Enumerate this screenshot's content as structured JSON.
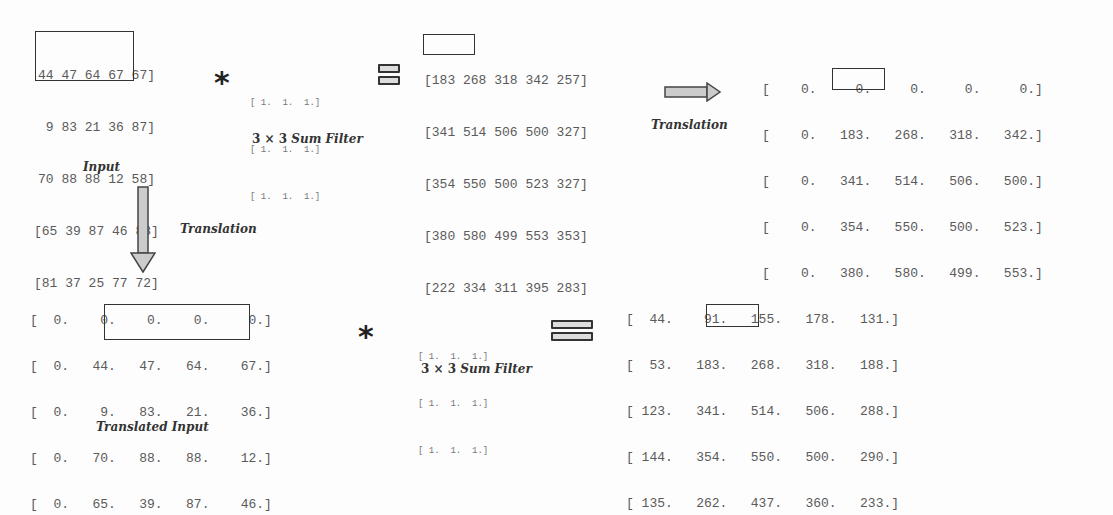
{
  "input": {
    "label": "Input",
    "rows": [
      "44 47 64 67 67]",
      " 9 83 21 36 87]",
      "70 88 88 12 58]",
      "[65 39 87 46 88]",
      "[81 37 25 77 72]"
    ],
    "values": [
      [
        44,
        47,
        64,
        67,
        67
      ],
      [
        9,
        83,
        21,
        36,
        87
      ],
      [
        70,
        88,
        88,
        12,
        58
      ],
      [
        65,
        39,
        87,
        46,
        88
      ],
      [
        81,
        37,
        25,
        77,
        72
      ]
    ]
  },
  "filter_top": {
    "label_prefix": "3 × 3 ",
    "label_italic": "Sum Filter",
    "rows": [
      "[ 1.  1.  1.]",
      "[ 1.  1.  1.]",
      "[ 1.  1.  1.]"
    ]
  },
  "output_top": {
    "rows": [
      "[183 268 318 342 257]",
      "[341 514 506 500 327]",
      "[354 550 500 523 327]",
      "[380 580 499 553 353]",
      "[222 334 311 395 283]"
    ],
    "values": [
      [
        183,
        268,
        318,
        342,
        257
      ],
      [
        341,
        514,
        506,
        500,
        327
      ],
      [
        354,
        550,
        500,
        523,
        327
      ],
      [
        380,
        580,
        499,
        553,
        353
      ],
      [
        222,
        334,
        311,
        395,
        283
      ]
    ]
  },
  "arrow_right": {
    "label": "Translation"
  },
  "translated_output": {
    "rows": [
      "[    0.     0.     0.     0.     0.]",
      "[    0.   183.   268.   318.   342.]",
      "[    0.   341.   514.   506.   500.]",
      "[    0.   354.   550.   500.   523.]",
      "[    0.   380.   580.   499.   553.]"
    ],
    "values": [
      [
        0,
        0,
        0,
        0,
        0
      ],
      [
        0,
        183,
        268,
        318,
        342
      ],
      [
        0,
        341,
        514,
        506,
        500
      ],
      [
        0,
        354,
        550,
        500,
        523
      ],
      [
        0,
        380,
        580,
        499,
        553
      ]
    ]
  },
  "arrow_down": {
    "label": "Translation"
  },
  "translated_input": {
    "label": "Translated Input",
    "rows": [
      "[  0.    0.    0.    0.     0.]",
      "[  0.   44.   47.   64.    67.]",
      "[  0.    9.   83.   21.    36.]",
      "[  0.   70.   88.   88.    12.]",
      "[  0.   65.   39.   87.    46.]"
    ],
    "values": [
      [
        0,
        0,
        0,
        0,
        0
      ],
      [
        0,
        44,
        47,
        64,
        67
      ],
      [
        0,
        9,
        83,
        21,
        36
      ],
      [
        0,
        70,
        88,
        88,
        12
      ],
      [
        0,
        65,
        39,
        87,
        46
      ]
    ]
  },
  "filter_bottom": {
    "label_prefix": "3 × 3 ",
    "label_italic": "Sum Filter",
    "rows": [
      "[ 1.  1.  1.]",
      "[ 1.  1.  1.]",
      "[ 1.  1.  1.]"
    ]
  },
  "output_bottom": {
    "rows": [
      "[  44.    91.   155.   178.   131.]",
      "[  53.   183.   268.   318.   188.]",
      "[ 123.   341.   514.   506.   288.]",
      "[ 144.   354.   550.   500.   290.]",
      "[ 135.   262.   437.   360.   233.]"
    ],
    "values": [
      [
        44,
        91,
        155,
        178,
        131
      ],
      [
        53,
        183,
        268,
        318,
        188
      ],
      [
        123,
        341,
        514,
        506,
        288
      ],
      [
        144,
        354,
        550,
        500,
        290
      ],
      [
        135,
        262,
        437,
        360,
        233
      ]
    ]
  },
  "operators": {
    "convolve": "*"
  }
}
